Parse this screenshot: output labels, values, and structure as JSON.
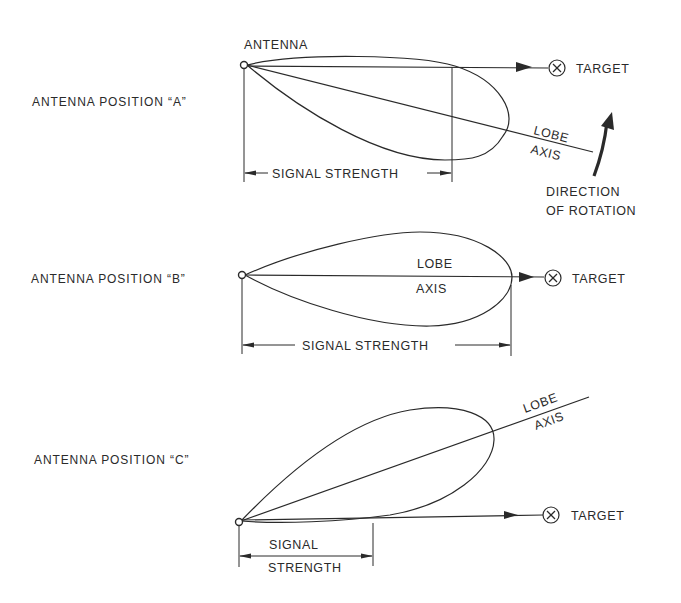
{
  "diagrams": [
    {
      "position_label": "ANTENNA POSITION “A”",
      "antenna_label": "ANTENNA",
      "target_label": "TARGET",
      "lobe_label": "LOBE",
      "axis_label": "AXIS",
      "signal_label": "SIGNAL STRENGTH",
      "rotation_label_line1": "DIRECTION",
      "rotation_label_line2": "OF ROTATION"
    },
    {
      "position_label": "ANTENNA POSITION “B”",
      "target_label": "TARGET",
      "lobe_label": "LOBE",
      "axis_label": "AXIS",
      "signal_label": "SIGNAL STRENGTH"
    },
    {
      "position_label": "ANTENNA POSITION “C”",
      "target_label": "TARGET",
      "lobe_label": "LOBE",
      "axis_label": "AXIS",
      "signal_label_line1": "SIGNAL",
      "signal_label_line2": "STRENGTH"
    }
  ],
  "colors": {
    "ink": "#2a2a2a",
    "background": "#ffffff"
  }
}
